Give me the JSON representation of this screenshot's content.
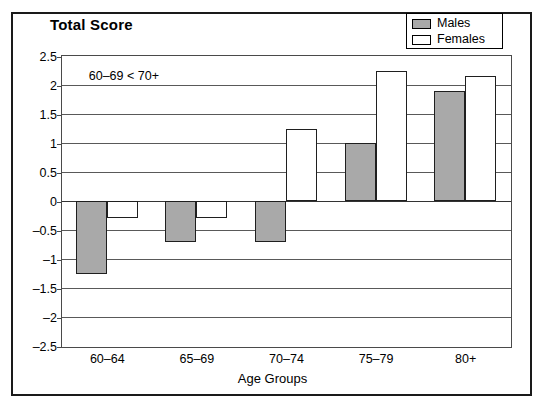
{
  "chart_data": {
    "type": "bar",
    "title": "Total Score",
    "xlabel": "Age Groups",
    "ylabel": "",
    "categories": [
      "60–64",
      "65–69",
      "70–74",
      "75–79",
      "80+"
    ],
    "series": [
      {
        "name": "Males",
        "color": "#a9a9a9",
        "values": [
          -1.25,
          -0.7,
          -0.7,
          1.0,
          1.9
        ]
      },
      {
        "name": "Females",
        "color": "#ffffff",
        "values": [
          -0.3,
          -0.3,
          1.25,
          2.25,
          2.15
        ]
      }
    ],
    "ylim": [
      -2.5,
      2.5
    ],
    "yticks": [
      2.5,
      2,
      1.5,
      1,
      0.5,
      0,
      -0.5,
      -1,
      -1.5,
      -2,
      -2.5
    ],
    "ytick_labels": [
      "2.5",
      "2",
      "1.5",
      "1",
      "0.5",
      "0",
      "–0.5",
      "–1",
      "–1.5",
      "–2",
      "–2.5"
    ],
    "grid": true,
    "legend_position": "top-right",
    "annotations": [
      {
        "text": "60–69 < 70+",
        "x_value": 0.12,
        "y_value": 2.28
      }
    ]
  },
  "legend": {
    "entries": [
      {
        "label": "Males",
        "swatch": "filled-gray-swatch"
      },
      {
        "label": "Females",
        "swatch": "empty-white-swatch"
      }
    ]
  }
}
